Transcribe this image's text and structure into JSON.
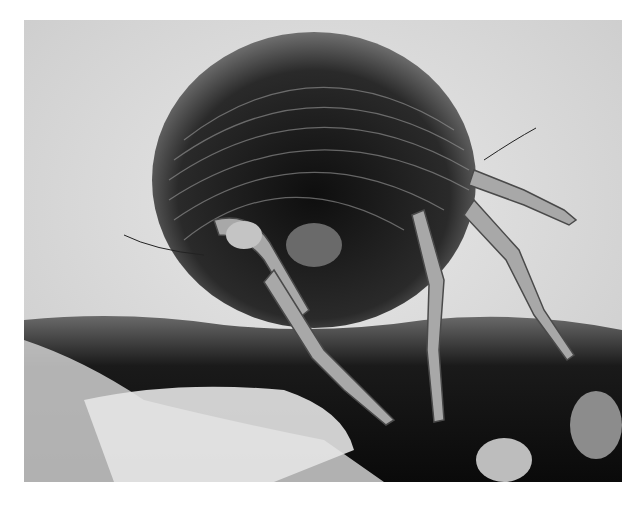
{
  "image": {
    "subject": "Scanning electron micrograph of a dust mite on fibrous substrate",
    "style": "grayscale SEM",
    "colors": {
      "background": "#ffffff",
      "sky": "#dcdcdc",
      "body_dark": "#1a1a1a",
      "body_mid": "#5a5a5a",
      "leg_light": "#b8b8b8",
      "substrate_dark": "#101010",
      "substrate_light": "#e6e6e6"
    },
    "frame": {
      "x": 24,
      "y": 20,
      "width": 598,
      "height": 462
    }
  }
}
